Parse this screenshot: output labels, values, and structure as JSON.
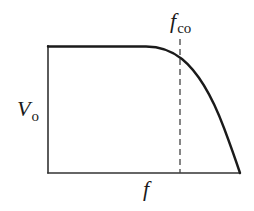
{
  "diagram": {
    "type": "frequency-response-lowpass",
    "labels": {
      "y_axis": "V",
      "y_axis_sub": "o",
      "x_axis": "f",
      "cutoff": "f",
      "cutoff_sub": "co"
    },
    "colors": {
      "curve": "#1a1a1a",
      "axes": "#333333",
      "dashed": "#444444",
      "background": "#ffffff"
    }
  }
}
